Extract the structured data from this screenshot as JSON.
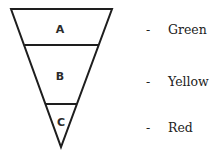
{
  "diagram": {
    "type": "inverted-triangle",
    "segments": [
      {
        "label": "A",
        "legend": "Green"
      },
      {
        "label": "B",
        "legend": "Yellow"
      },
      {
        "label": "C",
        "legend": "Red"
      }
    ]
  },
  "legend": {
    "dash": "-",
    "items": [
      "Green",
      "Yellow",
      "Red"
    ]
  }
}
